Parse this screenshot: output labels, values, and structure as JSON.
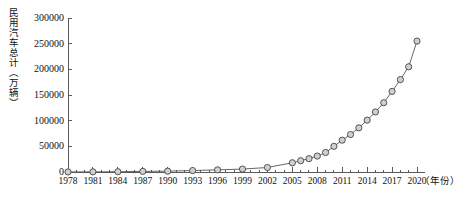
{
  "chart_data": {
    "type": "line",
    "title": "",
    "ylabel": "民用汽车总计（万辆）",
    "xlabel": "（年份）",
    "ylim": [
      0,
      300000
    ],
    "ytick_labels": [
      "0",
      "50000",
      "100000",
      "150000",
      "200000",
      "250000",
      "300000"
    ],
    "ytick_values": [
      0,
      50000,
      100000,
      150000,
      200000,
      250000,
      300000
    ],
    "xlim": [
      1978,
      2020
    ],
    "xtick_labels": [
      "1978",
      "1981",
      "1984",
      "1987",
      "1990",
      "1993",
      "1996",
      "1999",
      "2002",
      "2005",
      "2008",
      "2011",
      "2014",
      "2017",
      "2020"
    ],
    "xtick_values": [
      1978,
      1981,
      1984,
      1987,
      1990,
      1993,
      1996,
      1999,
      2002,
      2005,
      2008,
      2011,
      2014,
      2017,
      2020
    ],
    "minor_xticks": true,
    "grid": false,
    "legend": null,
    "marker": "circle",
    "line_color": "#555555",
    "marker_fill": "#d0d0d0",
    "marker_edge": "#444444",
    "x": [
      1978,
      1981,
      1984,
      1987,
      1990,
      1993,
      1996,
      1999,
      2002,
      2005,
      2006,
      2007,
      2008,
      2009,
      2010,
      2011,
      2012,
      2013,
      2014,
      2015,
      2016,
      2017,
      2018,
      2019,
      2020
    ],
    "values": [
      136,
      293,
      538,
      1219,
      1622,
      2817,
      4179,
      5698,
      8739,
      18000,
      22000,
      26000,
      31000,
      38000,
      50000,
      62000,
      73000,
      86000,
      101000,
      117000,
      135000,
      157000,
      180000,
      205000,
      255000
    ],
    "series": [
      {
        "name": "民用汽车总计",
        "values": [
          136,
          293,
          538,
          1219,
          1622,
          2817,
          4179,
          5698,
          8739,
          18000,
          22000,
          26000,
          31000,
          38000,
          50000,
          62000,
          73000,
          86000,
          101000,
          117000,
          135000,
          157000,
          180000,
          205000,
          255000
        ]
      }
    ]
  }
}
